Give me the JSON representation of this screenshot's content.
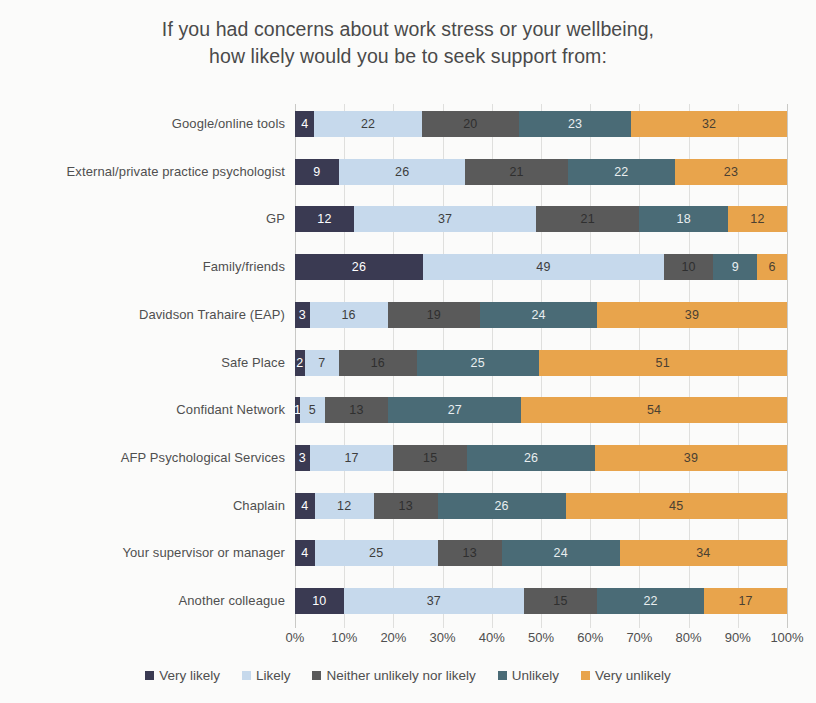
{
  "title": {
    "line1": "If you had concerns about work stress or your wellbeing,",
    "line2": "how likely would you be to seek support from:"
  },
  "colors": {
    "very_likely": "#3a3a52",
    "likely": "#c6d9ec",
    "neither": "#5a5a5a",
    "unlikely": "#4a6b76",
    "very_unlikely": "#e8a44c",
    "gridline": "#dfdfdd",
    "text": "#4f4f4f",
    "background": "#fbfbfa"
  },
  "axis": {
    "ticks": [
      "0%",
      "10%",
      "20%",
      "30%",
      "40%",
      "50%",
      "60%",
      "70%",
      "80%",
      "90%",
      "100%"
    ],
    "min": 0,
    "max": 100
  },
  "legend": {
    "items": [
      {
        "label": "Very likely",
        "color": "#3a3a52"
      },
      {
        "label": "Likely",
        "color": "#c6d9ec"
      },
      {
        "label": "Neither unlikely nor likely",
        "color": "#5a5a5a"
      },
      {
        "label": "Unlikely",
        "color": "#4a6b76"
      },
      {
        "label": "Very unlikely",
        "color": "#e8a44c"
      }
    ]
  },
  "chart_data": {
    "type": "bar",
    "orientation": "horizontal",
    "stacked": true,
    "normalized_percent": true,
    "title": "If you had concerns about work stress or your wellbeing, how likely would you be to seek support from:",
    "xlabel": "",
    "ylabel": "",
    "xlim": [
      0,
      100
    ],
    "grid": true,
    "legend_position": "bottom",
    "categories": [
      "Google/online tools",
      "External/private practice psychologist",
      "GP",
      "Family/friends",
      "Davidson Trahaire (EAP)",
      "Safe Place",
      "Confidant Network",
      "AFP Psychological Services",
      "Chaplain",
      "Your supervisor or manager",
      "Another colleague"
    ],
    "series": [
      {
        "name": "Very likely",
        "color": "#3a3a52",
        "values": [
          4,
          9,
          12,
          26,
          3,
          2,
          1,
          3,
          4,
          4,
          10
        ]
      },
      {
        "name": "Likely",
        "color": "#c6d9ec",
        "values": [
          22,
          26,
          37,
          49,
          16,
          7,
          5,
          17,
          12,
          25,
          37
        ]
      },
      {
        "name": "Neither unlikely nor likely",
        "color": "#5a5a5a",
        "values": [
          20,
          21,
          21,
          10,
          19,
          16,
          13,
          15,
          13,
          13,
          15
        ]
      },
      {
        "name": "Unlikely",
        "color": "#4a6b76",
        "values": [
          23,
          22,
          18,
          9,
          24,
          25,
          27,
          26,
          26,
          24,
          22
        ]
      },
      {
        "name": "Very unlikely",
        "color": "#e8a44c",
        "values": [
          32,
          23,
          12,
          6,
          39,
          51,
          54,
          39,
          45,
          34,
          17
        ]
      }
    ]
  }
}
